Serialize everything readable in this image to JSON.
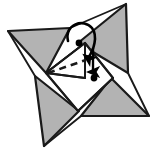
{
  "figure": {
    "width": 156,
    "height": 152,
    "background_color": "#ffffff",
    "colors": {
      "flap_fill": "#b3b3b3",
      "flap_fill_light": "#bdbdbd",
      "paper_white": "#ffffff",
      "line": "#1a1a1a",
      "dash": "#1a1a1a",
      "arrow": "#000000",
      "dot": "#000000"
    }
  },
  "shapes": {
    "blade_top_left": {
      "name": "top-left shaded blade",
      "points": "8,31 70,28 46,73"
    },
    "blade_top_right": {
      "name": "top-right shaded blade",
      "points": "126,4 128,73 78,43"
    },
    "blade_bottom_left": {
      "name": "bottom-left shaded blade",
      "points": "35,76 79,111 44,146"
    },
    "blade_bottom_right": {
      "name": "bottom-right shaded blade",
      "points": "111,78 149,116 81,116"
    },
    "center_panel": {
      "name": "white center square",
      "points": "46,73 85,43 113,78 78,111"
    },
    "inner_triangle": {
      "name": "white inner triangle flap",
      "points": "46,73 85,43 85,78"
    }
  },
  "creases": [
    {
      "name": "crease-center-top-left",
      "d": "M46,73 L85,43"
    },
    {
      "name": "crease-center-top-right",
      "d": "M85,43 L113,78"
    },
    {
      "name": "crease-center-bottom-right",
      "d": "M113,78 L78,111"
    },
    {
      "name": "crease-center-bottom-left",
      "d": "M78,111 L46,73"
    },
    {
      "name": "crease-vertical-inner",
      "d": "M85,43 L85,78"
    },
    {
      "name": "crease-horizontal-inner",
      "d": "M46,73 L85,78"
    },
    {
      "name": "crease-upper-edge",
      "d": "M70,28 L126,4"
    },
    {
      "name": "crease-right-edge",
      "d": "M128,73 L149,116"
    },
    {
      "name": "crease-left-edge",
      "d": "M8,31 L35,76"
    },
    {
      "name": "crease-lower-edge",
      "d": "M44,146 L81,116"
    }
  ],
  "annotations": {
    "valley_fold": {
      "name": "dashed valley fold line",
      "label": "valley fold",
      "d": "M48,73 L86,60",
      "dasharray": "7 5"
    },
    "rotation_arrow": {
      "name": "curved fold-over arrow",
      "label": "fold flap over",
      "d": "M68,41 C64,24 84,18 92,28 C98,36 94,50 88,58"
    },
    "straight_arrow": {
      "name": "downward fold arrow",
      "label": "push down",
      "d": "M93,48 L93,72"
    },
    "dot_upper": {
      "name": "reference point upper",
      "cx": 79,
      "cy": 43,
      "r": 3.4
    },
    "dot_lower": {
      "name": "reference point lower",
      "cx": 94,
      "cy": 78,
      "r": 3.4
    }
  }
}
